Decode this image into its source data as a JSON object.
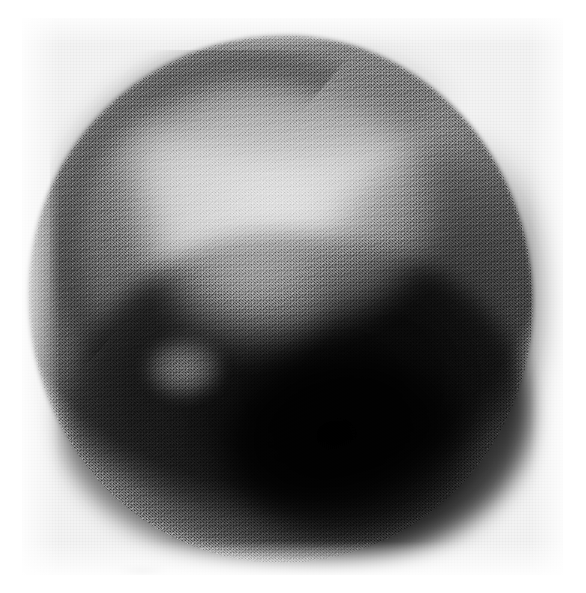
{
  "image": {
    "kind": "scintigram",
    "title": "Grainy circular radionuclide scan image",
    "caption": "",
    "modality_label": "dot-matrix scintigraphy print",
    "width_px": 586,
    "height_px": 593
  },
  "film": {
    "background_color": "#f3f3f3",
    "page_color": "#ffffff",
    "left_px": 22,
    "top_px": 18,
    "width_px": 541,
    "height_px": 557
  },
  "scan": {
    "shape": "circle",
    "center_x_px": 260,
    "center_y_px": 285,
    "radius_x_px": 252,
    "radius_y_px": 264,
    "darkest_color": "#050505",
    "brightest_color": "#e8e8e8",
    "mean_tone": "#8a8a8a"
  },
  "regions": [
    {
      "name": "bright-upper-field",
      "description": "large photopenic (light) zone in upper centre of the disc",
      "center_x_px": 260,
      "center_y_px": 188,
      "tone": "light"
    },
    {
      "name": "dark-rim-upper-left",
      "description": "darker crescent band along the upper-left margin of the disc",
      "center_x_px": 120,
      "center_y_px": 150,
      "tone": "dark"
    },
    {
      "name": "dark-lower-mass",
      "description": "dense very dark mass occupying the lower half and lower-right of the disc",
      "center_x_px": 300,
      "center_y_px": 420,
      "tone": "very-dark"
    },
    {
      "name": "dark-right-band",
      "description": "dark band sweeping up the right side from the lower mass",
      "center_x_px": 420,
      "center_y_px": 270,
      "tone": "dark"
    },
    {
      "name": "focal-bright-spot",
      "description": "small focal light spot in the left-lower quadrant",
      "center_x_px": 162,
      "center_y_px": 350,
      "tone": "light"
    },
    {
      "name": "smudge-mark",
      "description": "faint grey smudge on the film below the disc, near the lower-left",
      "center_x_px": 120,
      "center_y_px": 554,
      "tone": "faint"
    }
  ],
  "annotations": {
    "text_present": false,
    "labels": []
  }
}
